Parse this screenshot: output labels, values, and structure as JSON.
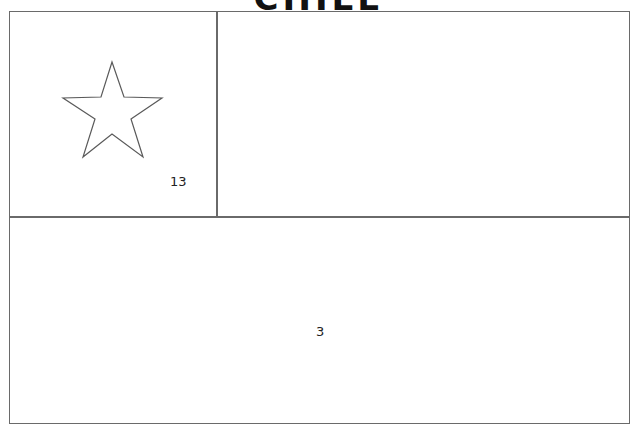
{
  "title": "CHILE",
  "flag": {
    "regions": [
      {
        "id": "canton",
        "number": "13"
      },
      {
        "id": "top-stripe",
        "number": ""
      },
      {
        "id": "bottom-stripe",
        "number": "3"
      }
    ],
    "star_icon": "star-outline-icon",
    "stroke_color": "#6a6a6a"
  }
}
